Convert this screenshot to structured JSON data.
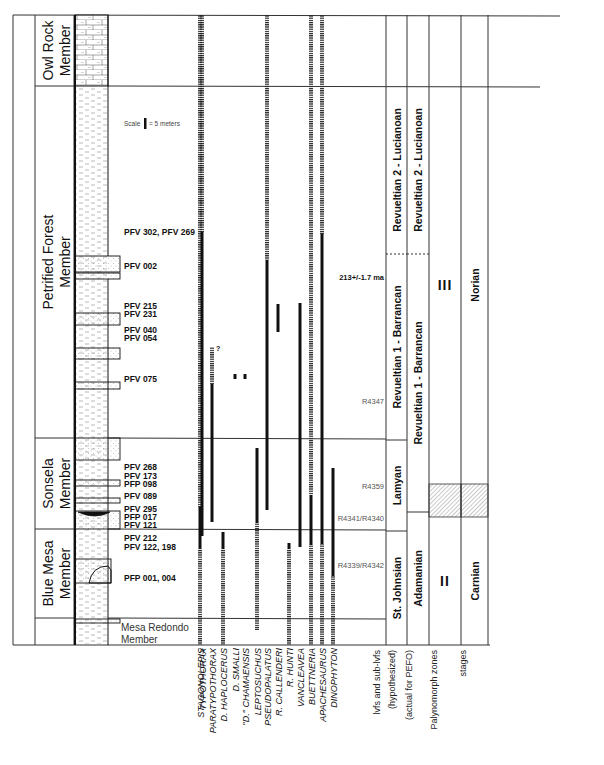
{
  "formation": {
    "name": "CHINLE FORMATION"
  },
  "members": [
    {
      "id": "owl-rock",
      "lines": [
        "Owl Rock",
        "Member"
      ],
      "top": 15,
      "bottom": 86
    },
    {
      "id": "petrified-forest",
      "lines": [
        "Petrified Forest",
        "Member"
      ],
      "top": 86,
      "bottom": 438
    },
    {
      "id": "sonsela",
      "lines": [
        "Sonsela",
        "Member"
      ],
      "top": 438,
      "bottom": 529
    },
    {
      "id": "blue-mesa",
      "lines": [
        "Blue Mesa",
        "Member"
      ],
      "top": 529,
      "bottom": 618
    },
    {
      "id": "mesa-redondo",
      "lines": [
        "Mesa Redondo",
        "Member"
      ],
      "top": 618,
      "bottom": 645
    }
  ],
  "scale_note": {
    "prefix": "Scale",
    "suffix": "= 5 meters"
  },
  "localities": [
    {
      "label": "PFV 302, PFV 269",
      "y": 232
    },
    {
      "label": "PFV 002",
      "y": 266
    },
    {
      "label": "PFV 215",
      "y": 306
    },
    {
      "label": "PFV 231",
      "y": 314
    },
    {
      "label": "PFV 040",
      "y": 330
    },
    {
      "label": "PFV 054",
      "y": 338
    },
    {
      "label": "PFV 075",
      "y": 379
    },
    {
      "label": "PFV 268",
      "y": 467
    },
    {
      "label": "PFV 173",
      "y": 476
    },
    {
      "label": "PFP 098",
      "y": 484
    },
    {
      "label": "PFV 089",
      "y": 496
    },
    {
      "label": "PFV 295",
      "y": 509
    },
    {
      "label": "PFP 017",
      "y": 517
    },
    {
      "label": "PFV 121",
      "y": 525
    },
    {
      "label": "PFV 212",
      "y": 538
    },
    {
      "label": "PFV 122, 198",
      "y": 547
    },
    {
      "label": "PFP 001, 004",
      "y": 578
    }
  ],
  "mesa_redondo_label": [
    "Mesa Redondo",
    "Member"
  ],
  "taxa": [
    {
      "name": "STAGONOLEPIS",
      "x": 200,
      "ranges": [
        {
          "type": "dash",
          "from": 15,
          "to": 507
        },
        {
          "type": "solid",
          "from": 507,
          "to": 549
        },
        {
          "type": "dash",
          "from": 549,
          "to": 645
        }
      ]
    },
    {
      "name": "TYPOTHORAX",
      "x": 202,
      "ranges": [
        {
          "type": "dash",
          "from": 15,
          "to": 232
        },
        {
          "type": "solid",
          "from": 232,
          "to": 536
        }
      ]
    },
    {
      "name": "PARATYPOTHORAX",
      "x": 212,
      "ranges": [
        {
          "type": "dash",
          "from": 347,
          "to": 384
        },
        {
          "type": "solid",
          "from": 384,
          "to": 522
        }
      ]
    },
    {
      "name": "D. HAPLOCERUS",
      "x": 223,
      "ranges": [
        {
          "type": "solid",
          "from": 532,
          "to": 549
        },
        {
          "type": "dash",
          "from": 549,
          "to": 645
        }
      ]
    },
    {
      "name": "D. SMALLI",
      "x": 235,
      "ranges": [
        {
          "type": "dot",
          "from": 374,
          "to": 379
        }
      ]
    },
    {
      "name": "\"D.\" CHAMAENSIS",
      "x": 245,
      "ranges": [
        {
          "type": "dot",
          "from": 374,
          "to": 379
        }
      ]
    },
    {
      "name": "LEPTOSUCHUS",
      "x": 257,
      "ranges": [
        {
          "type": "solid",
          "from": 448,
          "to": 523
        },
        {
          "type": "dash",
          "from": 523,
          "to": 630
        }
      ]
    },
    {
      "name": "PSEUDOPALATUS",
      "x": 267,
      "ranges": [
        {
          "type": "dash",
          "from": 15,
          "to": 260
        },
        {
          "type": "solid",
          "from": 260,
          "to": 510
        }
      ]
    },
    {
      "name": "R. CALLENDERI",
      "x": 278,
      "ranges": [
        {
          "type": "solid",
          "from": 304,
          "to": 332
        }
      ]
    },
    {
      "name": "R. HUNTI",
      "x": 289,
      "ranges": [
        {
          "type": "solid",
          "from": 543,
          "to": 549
        },
        {
          "type": "dash",
          "from": 549,
          "to": 645
        }
      ]
    },
    {
      "name": "VANCLEAVEA",
      "x": 300,
      "ranges": [
        {
          "type": "solid",
          "from": 303,
          "to": 547
        }
      ]
    },
    {
      "name": "BUETTNERIA",
      "x": 311,
      "ranges": [
        {
          "type": "dash",
          "from": 15,
          "to": 495
        },
        {
          "type": "solid",
          "from": 495,
          "to": 545
        },
        {
          "type": "dash",
          "from": 545,
          "to": 645
        }
      ]
    },
    {
      "name": "APACHESAURUS",
      "x": 322,
      "ranges": [
        {
          "type": "dash",
          "from": 15,
          "to": 234
        },
        {
          "type": "solid",
          "from": 234,
          "to": 544
        },
        {
          "type": "dash",
          "from": 544,
          "to": 645
        }
      ]
    },
    {
      "name": "DINOPHYTON",
      "x": 333,
      "ranges": [
        {
          "type": "solid",
          "from": 468,
          "to": 576
        },
        {
          "type": "dash",
          "from": 576,
          "to": 645
        }
      ]
    }
  ],
  "question_mark": {
    "label": "?",
    "x": 216,
    "y": 351
  },
  "dates": [
    {
      "label": "213+/-1.7 ma",
      "y": 277,
      "bold": true
    },
    {
      "label": "R4347",
      "y": 401,
      "bold": false
    },
    {
      "label": "R4359",
      "y": 486,
      "bold": false
    },
    {
      "label": "R4341/R4340",
      "y": 518,
      "bold": false
    },
    {
      "label": "R4339/R4342",
      "y": 565,
      "bold": false
    }
  ],
  "columns": [
    {
      "id": "lvfs-hypothesized",
      "header_lines": [
        "lvfs and sub-lvfs",
        "(hypothesized)"
      ],
      "zones": [
        {
          "label": "Revueltian 2 - Lucianoan",
          "top": 86,
          "bottom": 254,
          "boundary": "dashed"
        },
        {
          "label": "Revueltian 1 - Barrancan",
          "top": 254,
          "bottom": 440,
          "boundary": "solid"
        },
        {
          "label": "Lamyan",
          "top": 440,
          "bottom": 531,
          "boundary": "solid"
        },
        {
          "label": "St. Johnsian",
          "top": 531,
          "bottom": 645,
          "boundary": "solid"
        }
      ]
    },
    {
      "id": "lvfs-actual",
      "header_lines": [
        "(actual for PEFO)"
      ],
      "zones": [
        {
          "label": "Revueltian 2 - Lucianoan",
          "top": 86,
          "bottom": 254,
          "boundary": "dashed"
        },
        {
          "label": "Revueltian 1 - Barrancan",
          "top": 254,
          "bottom": 512,
          "boundary": "solid"
        },
        {
          "label": "Adamanian",
          "top": 512,
          "bottom": 645,
          "boundary": "solid"
        }
      ]
    },
    {
      "id": "palynomorph-zones",
      "header_lines": [
        "Palynomorph zones"
      ],
      "zones": [
        {
          "label": "III",
          "top": 86,
          "bottom": 484,
          "boundary": "solid"
        },
        {
          "label": "",
          "top": 484,
          "bottom": 517,
          "hatched": true
        },
        {
          "label": "II",
          "top": 517,
          "bottom": 645,
          "boundary": "solid"
        }
      ]
    },
    {
      "id": "stages",
      "header_lines": [
        "stages"
      ],
      "zones": [
        {
          "label": "Norian",
          "top": 86,
          "bottom": 484,
          "boundary": "solid"
        },
        {
          "label": "",
          "top": 484,
          "bottom": 517,
          "hatched": true
        },
        {
          "label": "Carnian",
          "top": 517,
          "bottom": 645,
          "boundary": "solid"
        }
      ]
    }
  ],
  "colors": {
    "ink": "#111111",
    "rule": "#333333",
    "muted_text": "#555555",
    "sandstone_dot": "#777777",
    "mudstone_dash": "#888888"
  }
}
